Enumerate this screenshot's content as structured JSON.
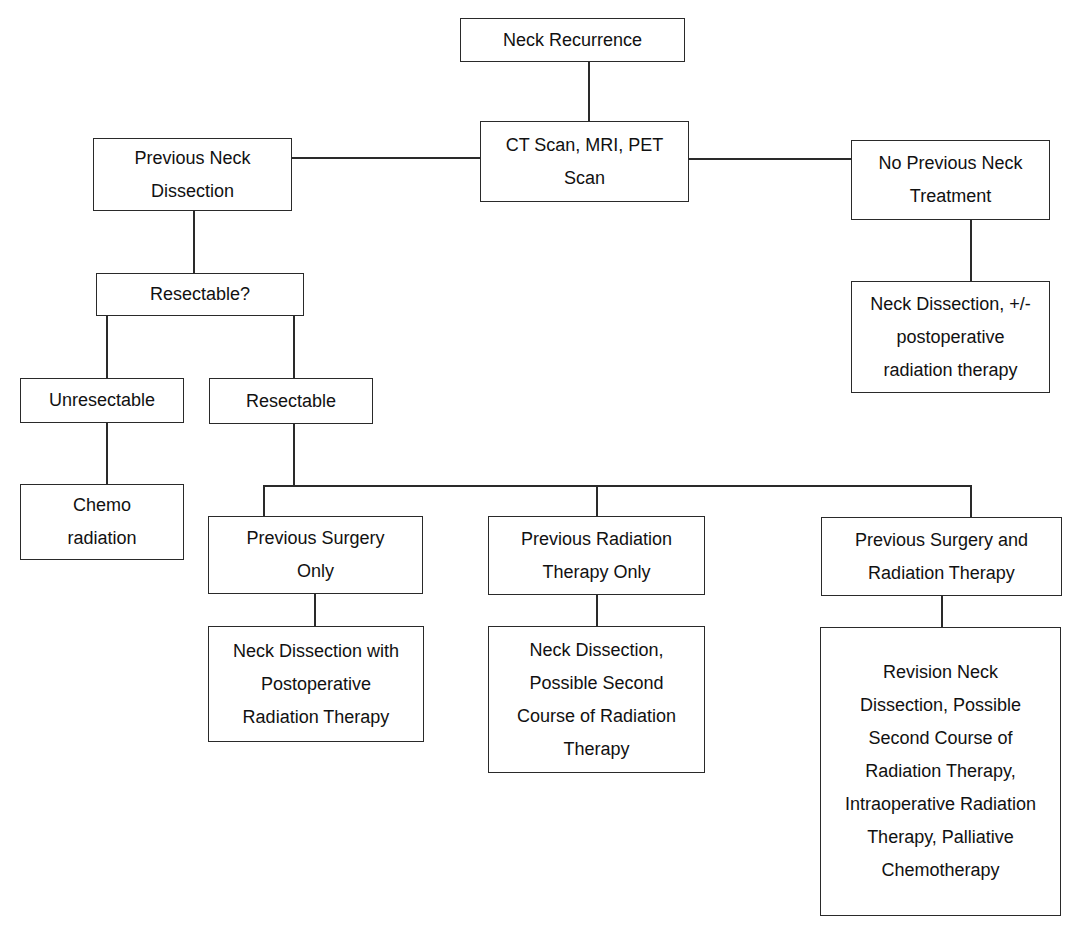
{
  "diagram": {
    "type": "flowchart",
    "nodes": {
      "neck_recurrence": "Neck Recurrence",
      "imaging": "CT Scan, MRI, PET Scan",
      "previous_neck_dissection": "Previous Neck Dissection",
      "no_previous_treatment": "No Previous Neck Treatment",
      "no_prev_outcome": "Neck Dissection, +/- postoperative radiation therapy",
      "resectable_question": "Resectable?",
      "unresectable": "Unresectable",
      "resectable": "Resectable",
      "chemoradiation": "Chemo radiation",
      "prev_surgery_only": "Previous Surgery Only",
      "prev_surgery_only_outcome": "Neck Dissection with Postoperative Radiation Therapy",
      "prev_rt_only": "Previous Radiation Therapy Only",
      "prev_rt_only_outcome": "Neck Dissection, Possible Second Course of Radiation Therapy",
      "prev_surgery_rt": "Previous Surgery and Radiation Therapy",
      "prev_surgery_rt_outcome": "Revision Neck Dissection, Possible Second Course of Radiation Therapy, Intraoperative Radiation Therapy, Palliative Chemotherapy"
    },
    "edges": [
      [
        "neck_recurrence",
        "imaging"
      ],
      [
        "imaging",
        "previous_neck_dissection"
      ],
      [
        "imaging",
        "no_previous_treatment"
      ],
      [
        "no_previous_treatment",
        "no_prev_outcome"
      ],
      [
        "previous_neck_dissection",
        "resectable_question"
      ],
      [
        "resectable_question",
        "unresectable"
      ],
      [
        "resectable_question",
        "resectable"
      ],
      [
        "unresectable",
        "chemoradiation"
      ],
      [
        "resectable",
        "prev_surgery_only"
      ],
      [
        "resectable",
        "prev_rt_only"
      ],
      [
        "resectable",
        "prev_surgery_rt"
      ],
      [
        "prev_surgery_only",
        "prev_surgery_only_outcome"
      ],
      [
        "prev_rt_only",
        "prev_rt_only_outcome"
      ],
      [
        "prev_surgery_rt",
        "prev_surgery_rt_outcome"
      ]
    ]
  }
}
